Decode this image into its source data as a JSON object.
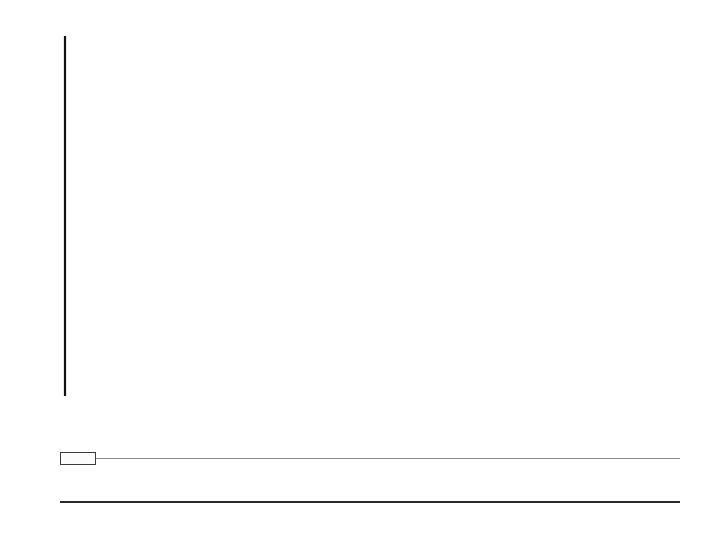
{
  "chart_data": {
    "type": "line",
    "title": "",
    "subtitle": "",
    "xlabel": "",
    "ylabel": "",
    "legend_label": "In Percent",
    "legend_position": "below-chart-left",
    "grid": "vertical-dotted",
    "ylim": [
      40,
      90
    ],
    "yticks": [
      {
        "value": 90,
        "label": "90%"
      },
      {
        "value": 80,
        "label": "80"
      },
      {
        "value": 70,
        "label": "70"
      },
      {
        "value": 60,
        "label": "60"
      },
      {
        "value": 50,
        "label": "50"
      },
      {
        "value": 40,
        "label": "40"
      }
    ],
    "categories": [
      "1973",
      "75",
      "76",
      "78",
      "80",
      "83",
      "84",
      "86",
      "87",
      "88",
      "89",
      "90",
      "91",
      "93",
      "94",
      "96",
      "98",
      "99"
    ],
    "values": [
      80,
      75,
      69,
      67,
      72,
      76,
      73,
      80,
      81,
      79,
      81,
      81,
      78,
      73,
      72,
      69,
      66,
      69
    ],
    "series": [
      {
        "name": "In Percent",
        "values": [
          80,
          75,
          69,
          67,
          72,
          76,
          73,
          80,
          81,
          79,
          81,
          81,
          78,
          73,
          72,
          69,
          66,
          69
        ]
      }
    ],
    "style": {
      "line_render": "white ribbon band with thin black outlines",
      "band_thickness_units": 1.2,
      "line_color": "#333333",
      "band_fill": "#ffffff",
      "grid_color": "#d8d8d8",
      "axis_color": "#111111",
      "xaxis_bar_color": "#000000",
      "xaxis_bar_text_color": "#ffffff"
    }
  },
  "axis": {
    "y_labels": [
      "90%",
      "80",
      "70",
      "60",
      "50",
      "40"
    ],
    "x_labels": [
      "1973",
      "75",
      "76",
      "78",
      "80",
      "83",
      "84",
      "86",
      "87",
      "88",
      "89",
      "90",
      "91",
      "93",
      "94",
      "96",
      "98",
      "99"
    ]
  },
  "legend": {
    "title": "In Percent",
    "swatch_fill": "#fbfbfb",
    "swatch_border": "#3a3a3a"
  },
  "table": {
    "value_row": [
      "80",
      "75",
      "69",
      "67",
      "72",
      "76",
      "73",
      "80",
      "81",
      "79",
      "81",
      "81",
      "78",
      "73",
      "72",
      "69",
      "66",
      "69"
    ],
    "year_row": [
      "1973",
      "75",
      "76",
      "78",
      "80",
      "83",
      "84",
      "86",
      "87",
      "88",
      "89",
      "90",
      "91",
      "93",
      "94",
      "96",
      "98",
      "99"
    ]
  }
}
